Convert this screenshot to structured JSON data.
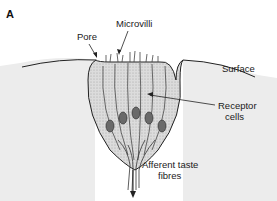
{
  "figure": {
    "panel_label": "A",
    "labels": {
      "pore": "Pore",
      "microvilli": "Microvilli",
      "surface": "Surface",
      "receptor_line1": "Receptor",
      "receptor_line2": "cells",
      "afferent_line1": "Afferent taste",
      "afferent_line2": "fibres"
    },
    "colors": {
      "tissue": "#ececec",
      "cells": "#d9d9d9",
      "outline": "#222222",
      "nucleus": "#6a6a6a"
    }
  }
}
